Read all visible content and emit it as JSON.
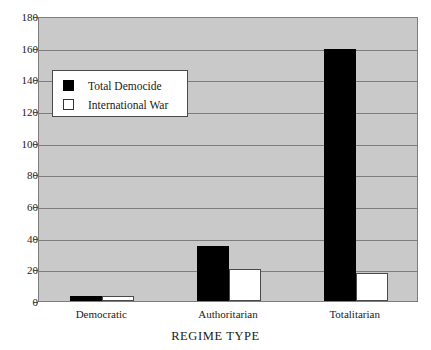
{
  "chart_data": {
    "type": "bar",
    "title": "",
    "xlabel": "REGIME TYPE",
    "ylabel": "",
    "categories": [
      "Democratic",
      "Authoritarian",
      "Totalitarian"
    ],
    "series": [
      {
        "name": "Total Democide",
        "color": "#000000",
        "values": [
          3,
          35,
          159
        ]
      },
      {
        "name": "International War",
        "color": "#ffffff",
        "values": [
          3,
          20,
          18
        ]
      }
    ],
    "ylim": [
      0,
      180
    ],
    "yticks": [
      0,
      20,
      40,
      60,
      80,
      100,
      120,
      140,
      160,
      180
    ],
    "grid": true,
    "legend_position": "upper-left",
    "plot_background": "#c9c9c9",
    "gridline_color": "#7d7d7d",
    "axis_color": "#4a4a4a"
  }
}
